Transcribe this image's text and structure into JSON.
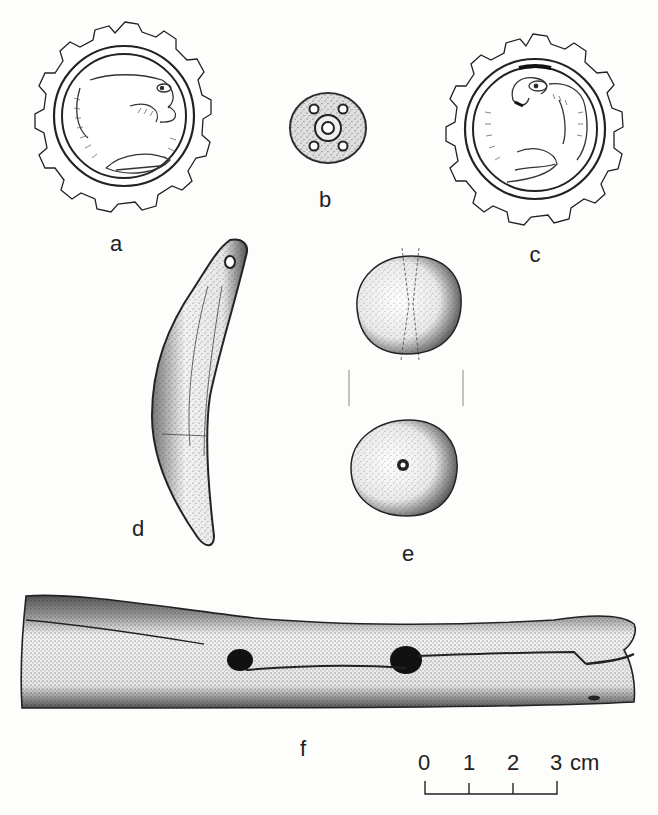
{
  "plate": {
    "background_color": "#fdfdfc",
    "ink_color": "#1a1a1a",
    "figures": [
      {
        "id": "a",
        "label": "a",
        "description": "cog-edged round seal with animal (feline) motif, facing right"
      },
      {
        "id": "b",
        "label": "b",
        "description": "small round disc bead with central hole and four dots"
      },
      {
        "id": "c",
        "label": "c",
        "description": "cog-edged round seal with bird/griffin motif, facing left"
      },
      {
        "id": "d",
        "label": "d",
        "description": "curved tooth-shaped pendant with suspension hole"
      },
      {
        "id": "e",
        "label": "e",
        "description": "round bead shown in two views (side and top with central perforation)"
      },
      {
        "id": "f",
        "label": "f",
        "description": "long bone tube/flute fragment with holes"
      }
    ]
  },
  "scale_bar": {
    "ticks": [
      "0",
      "1",
      "2",
      "3"
    ],
    "unit": "cm"
  }
}
